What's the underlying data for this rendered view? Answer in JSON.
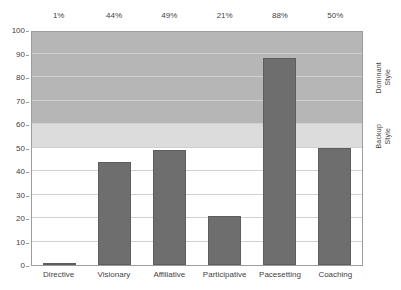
{
  "chart_data": {
    "type": "bar",
    "title": "",
    "subtitle": "",
    "xlabel": "",
    "ylabel": "",
    "categories": [
      "Directive",
      "Visionary",
      "Affiliative",
      "Participative",
      "Pacesetting",
      "Coaching"
    ],
    "values": [
      1,
      44,
      49,
      21,
      88,
      50
    ],
    "value_labels": [
      "1%",
      "44%",
      "49%",
      "21%",
      "88%",
      "50%"
    ],
    "ylim": [
      0,
      100
    ],
    "y_ticks": [
      0,
      10,
      20,
      30,
      40,
      50,
      60,
      70,
      80,
      90,
      100
    ],
    "y_tick_labels": [
      "0",
      "10",
      "20",
      "30",
      "40",
      "50",
      "60",
      "70",
      "80",
      "90",
      "100"
    ],
    "grid": true,
    "legend_position": "none",
    "series": [
      {
        "name": "Leadership style usage",
        "values": [
          1,
          44,
          49,
          21,
          88,
          50
        ],
        "color": "#6e6e6e"
      }
    ],
    "bands": [
      {
        "name": "Dominant Style",
        "label": "Dominant\nStyle",
        "range": [
          60,
          100
        ],
        "color": "#b6b6b6"
      },
      {
        "name": "Backup Style",
        "label": "Backup\nStyle",
        "range": [
          50,
          60
        ],
        "color": "#dcdcdc"
      }
    ],
    "colors": {
      "bar": "#6e6e6e",
      "bar_border": "#5d5d5d",
      "band_dominant": "#b6b6b6",
      "band_backup": "#dcdcdc",
      "gridline": "#d0d0d0",
      "axis": "#9c9c9c",
      "text": "#3f3f3f",
      "background": "#ffffff"
    }
  }
}
